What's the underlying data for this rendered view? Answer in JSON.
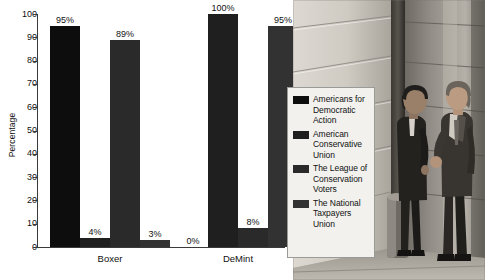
{
  "chart_data": {
    "type": "bar",
    "title": "",
    "xlabel": "",
    "ylabel": "Percentage",
    "ylim": [
      0,
      100
    ],
    "ytick_labels": [
      "100",
      "90",
      "80",
      "70",
      "60",
      "50",
      "40",
      "30",
      "20",
      "10",
      "0"
    ],
    "ytick_values": [
      100,
      90,
      80,
      70,
      60,
      50,
      40,
      30,
      20,
      10,
      0
    ],
    "grid": false,
    "legend_position": "right",
    "categories": [
      "Boxer",
      "DeMint"
    ],
    "series": [
      {
        "name": "Americans for Democratic Action",
        "color": "#0d0d0d",
        "values": [
          95,
          0
        ],
        "labels": [
          "95%",
          "0%"
        ]
      },
      {
        "name": "American Conservative Union",
        "color": "#1f1f1f",
        "values": [
          4,
          100
        ],
        "labels": [
          "4%",
          "100%"
        ]
      },
      {
        "name": "The League of Conservation Voters",
        "color": "#2a2a2a",
        "values": [
          89,
          8
        ],
        "labels": [
          "89%",
          "8%"
        ]
      },
      {
        "name": "The National Taxpayers Union",
        "color": "#323232",
        "values": [
          3,
          95
        ],
        "labels": [
          "3%",
          "95%"
        ]
      }
    ]
  },
  "axis": {
    "y_title": "Percentage"
  },
  "legend": {
    "items": [
      {
        "label": "Americans for Democratic Action",
        "color": "#0d0d0d"
      },
      {
        "label": "American Conservative Union",
        "color": "#1f1f1f"
      },
      {
        "label": "The League of Conservation Voters",
        "color": "#2a2a2a"
      },
      {
        "label": "The National Taxpayers Union",
        "color": "#323232"
      }
    ]
  },
  "photo": {
    "description": "Two men in dark suits standing and talking outside a stone government building"
  }
}
